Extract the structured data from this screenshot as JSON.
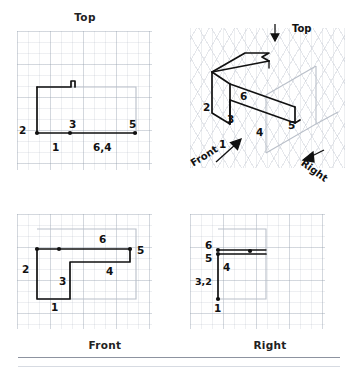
{
  "sheet": {
    "type": "orthographic-projection-worksheet",
    "description": "Multiview engineering drawing: Top, Front, Right orthographic views and an isometric pictorial of an L-shaped bracket with numbered surface/vertex callouts 1 through 6."
  },
  "views": {
    "top": {
      "title": "Top",
      "labels": [
        {
          "id": "v2",
          "text": "2"
        },
        {
          "id": "v1",
          "text": "1"
        },
        {
          "id": "v3",
          "text": "3"
        },
        {
          "id": "v64",
          "text": "6,4"
        },
        {
          "id": "v5",
          "text": "5"
        }
      ]
    },
    "front": {
      "title": "Front",
      "labels": [
        {
          "id": "v2",
          "text": "2"
        },
        {
          "id": "v1",
          "text": "1"
        },
        {
          "id": "v3",
          "text": "3"
        },
        {
          "id": "v4",
          "text": "4"
        },
        {
          "id": "v6",
          "text": "6"
        },
        {
          "id": "v5",
          "text": "5"
        }
      ]
    },
    "right": {
      "title": "Right",
      "labels": [
        {
          "id": "v6",
          "text": "6"
        },
        {
          "id": "v5",
          "text": "5"
        },
        {
          "id": "v4",
          "text": "4"
        },
        {
          "id": "v32",
          "text": "3,2"
        },
        {
          "id": "v1",
          "text": "1"
        }
      ]
    },
    "isometric": {
      "title": "",
      "labels": [
        {
          "id": "v2",
          "text": "2"
        },
        {
          "id": "v1",
          "text": "1"
        },
        {
          "id": "v3",
          "text": "3"
        },
        {
          "id": "v4",
          "text": "4"
        },
        {
          "id": "v6",
          "text": "6"
        },
        {
          "id": "v5",
          "text": "5"
        }
      ],
      "axes": [
        {
          "id": "top-axis",
          "text": "Top"
        },
        {
          "id": "front-axis",
          "text": "Front"
        },
        {
          "id": "right-axis",
          "text": "Right"
        }
      ]
    }
  },
  "colors": {
    "ink": "#111111",
    "grid": "#96a0af",
    "ghost": "#b9bfc9",
    "rule": "#8d93a0",
    "paper": "#ffffff"
  }
}
